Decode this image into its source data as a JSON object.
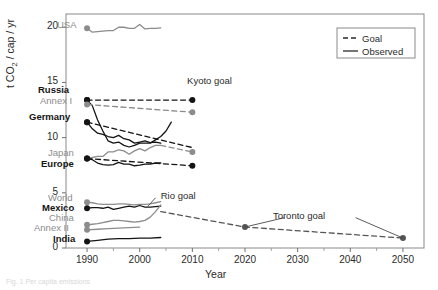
{
  "figure": {
    "caption": "Fig. 1  Per capita emissions"
  },
  "axes": {
    "xlabel": "Year",
    "ylabel_prefix": "t CO",
    "ylabel_sub": "2",
    "ylabel_suffix": " / cap / yr",
    "xticks": [
      "1990",
      "2000",
      "2010",
      "2020",
      "2030",
      "2040",
      "2050"
    ],
    "yticks": [
      "0",
      "5",
      "10",
      "15",
      "20"
    ],
    "xlim": [
      1986,
      2054
    ],
    "ylim": [
      0,
      21.2
    ],
    "grid": false
  },
  "legend": {
    "position": "top-right",
    "items": [
      {
        "label": "Goal",
        "style": "dashed"
      },
      {
        "label": "Observed",
        "style": "solid"
      }
    ]
  },
  "annotations": [
    {
      "name": "kyoto-goal",
      "text": "Kyoto goal",
      "x": 2009,
      "y": 15.1
    },
    {
      "name": "rio-goal",
      "text": "Rio goal",
      "x": 2004,
      "y": 4.75
    },
    {
      "name": "toronto-goal",
      "text": "Toronto goal",
      "x": 2031,
      "y": 2.9
    }
  ],
  "series_labels": [
    {
      "name": "USA",
      "color": "#8c8c8c",
      "bold": false,
      "x": 57,
      "y": 20
    },
    {
      "name": "Russia",
      "color": "#141414",
      "bold": true,
      "x": 38,
      "y": 85
    },
    {
      "name": "Annex I",
      "color": "#8c8c8c",
      "bold": false,
      "x": 40,
      "y": 96
    },
    {
      "name": "Germany",
      "color": "#141414",
      "bold": true,
      "x": 29,
      "y": 112
    },
    {
      "name": "Japan",
      "color": "#8c8c8c",
      "bold": false,
      "x": 48,
      "y": 148
    },
    {
      "name": "Europe",
      "color": "#141414",
      "bold": true,
      "x": 41,
      "y": 159
    },
    {
      "name": "World",
      "color": "#8c8c8c",
      "bold": false,
      "x": 48,
      "y": 193
    },
    {
      "name": "Mexico",
      "color": "#141414",
      "bold": true,
      "x": 42,
      "y": 203
    },
    {
      "name": "China",
      "color": "#8c8c8c",
      "bold": false,
      "x": 49,
      "y": 213
    },
    {
      "name": "Annex II",
      "color": "#8c8c8c",
      "bold": false,
      "x": 34,
      "y": 223
    },
    {
      "name": "India",
      "color": "#141414",
      "bold": true,
      "x": 53,
      "y": 234
    }
  ],
  "chart_data": {
    "type": "line",
    "title": "",
    "xlabel": "Year",
    "ylabel": "t CO2 / cap / yr",
    "xlim": [
      1986,
      2054
    ],
    "ylim": [
      0,
      21.2
    ],
    "grid": false,
    "legend": [
      "Goal",
      "Observed"
    ],
    "annotations": [
      "Kyoto goal",
      "Rio goal",
      "Toronto goal"
    ],
    "series": [
      {
        "name": "USA",
        "color": "#8c8c8c",
        "style": "solid",
        "marker_at_start": true,
        "x": [
          1990,
          1991,
          1992,
          1993,
          1994,
          1995,
          1996,
          1997,
          1998,
          1999,
          2000,
          2001,
          2002,
          2003,
          2004
        ],
        "y": [
          19.9,
          19.55,
          19.6,
          19.65,
          19.7,
          19.7,
          20.0,
          20.0,
          19.9,
          19.9,
          20.25,
          19.85,
          19.9,
          19.9,
          19.95
        ]
      },
      {
        "name": "Russia",
        "color": "#141414",
        "style": "solid",
        "marker_at_start": true,
        "x": [
          1990,
          1991,
          1992,
          1993,
          1994,
          1995,
          1996,
          1997,
          1998,
          1999,
          2000,
          2001,
          2002,
          2003,
          2004,
          2005,
          2006
        ],
        "y": [
          13.4,
          12.9,
          11.6,
          10.6,
          9.7,
          9.5,
          9.6,
          9.3,
          9.15,
          9.3,
          9.5,
          9.5,
          9.5,
          9.8,
          10.1,
          10.6,
          11.4
        ]
      },
      {
        "name": "Russia goal",
        "color": "#141414",
        "style": "dashed",
        "marker_at_start": true,
        "marker_at_end": true,
        "x": [
          1990,
          2010
        ],
        "y": [
          13.4,
          13.4
        ]
      },
      {
        "name": "Annex I",
        "color": "#8c8c8c",
        "style": "dashed",
        "marker_at_start": true,
        "marker_at_end": true,
        "x": [
          1990,
          2010
        ],
        "y": [
          13.0,
          12.3
        ]
      },
      {
        "name": "Germany",
        "color": "#141414",
        "style": "solid",
        "marker_at_start": true,
        "x": [
          1990,
          1991,
          1992,
          1993,
          1994,
          1995,
          1996,
          1997,
          1998,
          1999,
          2000,
          2001,
          2002,
          2003,
          2004
        ],
        "y": [
          11.4,
          10.8,
          10.4,
          10.3,
          10.1,
          10.0,
          10.2,
          9.9,
          9.8,
          9.5,
          9.6,
          9.7,
          9.55,
          9.6,
          9.5
        ]
      },
      {
        "name": "Germany goal",
        "color": "#141414",
        "style": "dashed",
        "marker_at_start": true,
        "x": [
          1990,
          2010
        ],
        "y": [
          11.4,
          9.1
        ]
      },
      {
        "name": "Japan",
        "color": "#8c8c8c",
        "style": "solid",
        "marker_at_start": true,
        "x": [
          1990,
          1991,
          1992,
          1993,
          1994,
          1995,
          1996,
          1997,
          1998,
          1999,
          2000,
          2001,
          2002,
          2003,
          2004
        ],
        "y": [
          8.1,
          8.2,
          8.3,
          8.3,
          8.7,
          8.7,
          8.9,
          8.8,
          8.5,
          8.8,
          9.0,
          8.8,
          9.1,
          9.3,
          9.3
        ]
      },
      {
        "name": "Japan goal",
        "color": "#8c8c8c",
        "style": "dashed",
        "marker_at_end": true,
        "x": [
          2004,
          2010
        ],
        "y": [
          9.3,
          8.7
        ]
      },
      {
        "name": "Europe",
        "color": "#141414",
        "style": "solid",
        "marker_at_start": true,
        "x": [
          1990,
          1991,
          1992,
          1993,
          1994,
          1995,
          1996,
          1997,
          1998,
          1999,
          2000,
          2001,
          2002,
          2003,
          2004
        ],
        "y": [
          8.1,
          8.0,
          7.7,
          7.55,
          7.5,
          7.55,
          7.75,
          7.6,
          7.6,
          7.45,
          7.5,
          7.6,
          7.6,
          7.7,
          7.7
        ]
      },
      {
        "name": "Europe goal",
        "color": "#141414",
        "style": "dashed",
        "marker_at_start": true,
        "marker_at_end": true,
        "x": [
          1990,
          2010
        ],
        "y": [
          8.1,
          7.45
        ]
      },
      {
        "name": "World",
        "color": "#8c8c8c",
        "style": "solid",
        "marker_at_start": true,
        "x": [
          1990,
          1991,
          1992,
          1993,
          1994,
          1995,
          1996,
          1997,
          1998,
          1999,
          2000,
          2001,
          2002,
          2003,
          2004
        ],
        "y": [
          4.15,
          4.1,
          4.0,
          3.95,
          3.95,
          3.95,
          4.0,
          4.0,
          3.95,
          3.9,
          3.95,
          3.95,
          4.0,
          4.1,
          4.2
        ]
      },
      {
        "name": "Mexico",
        "color": "#141414",
        "style": "solid",
        "marker_at_start": true,
        "x": [
          1990,
          1991,
          1992,
          1993,
          1994,
          1995,
          1996,
          1997,
          1998,
          1999,
          2000,
          2001,
          2002,
          2003,
          2004
        ],
        "y": [
          3.6,
          3.65,
          3.65,
          3.6,
          3.7,
          3.5,
          3.6,
          3.7,
          3.8,
          3.7,
          3.85,
          3.7,
          3.7,
          3.75,
          3.8
        ]
      },
      {
        "name": "China",
        "color": "#8c8c8c",
        "style": "solid",
        "marker_at_start": true,
        "x": [
          1990,
          1991,
          1992,
          1993,
          1994,
          1995,
          1996,
          1997,
          1998,
          1999,
          2000,
          2001,
          2002,
          2003,
          2004
        ],
        "y": [
          2.1,
          2.15,
          2.2,
          2.3,
          2.4,
          2.5,
          2.5,
          2.45,
          2.4,
          2.35,
          2.4,
          2.5,
          2.8,
          3.3,
          3.9
        ]
      },
      {
        "name": "Annex II",
        "color": "#8c8c8c",
        "style": "solid",
        "marker_at_start": true,
        "x": [
          1990,
          1992,
          1994,
          1996,
          1998,
          2000
        ],
        "y": [
          1.65,
          1.7,
          1.75,
          1.8,
          1.85,
          1.9
        ]
      },
      {
        "name": "India",
        "color": "#141414",
        "style": "solid",
        "marker_at_start": true,
        "x": [
          1990,
          1992,
          1994,
          1996,
          1998,
          2000,
          2002,
          2004
        ],
        "y": [
          0.6,
          0.7,
          0.8,
          0.85,
          0.85,
          0.9,
          0.9,
          0.95
        ]
      },
      {
        "name": "Toronto goal",
        "color": "#555555",
        "style": "dashed",
        "marker_points": [
          [
            2020,
            1.9
          ],
          [
            2050,
            0.9
          ]
        ],
        "x": [
          2004,
          2020,
          2050
        ],
        "y": [
          3.3,
          1.9,
          0.9
        ]
      }
    ]
  }
}
